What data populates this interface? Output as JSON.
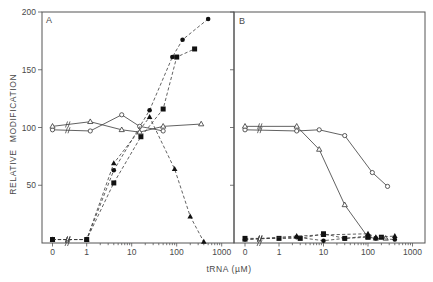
{
  "figure": {
    "ylabel_word1": "RELATIVE",
    "ylabel_word2": "MODIFICATION",
    "xlabel": "tRNA  (µM)",
    "y_tick_labels": [
      "50",
      "100",
      "150",
      "200"
    ],
    "x_tick_labels": [
      "0",
      "1",
      "10",
      "100",
      "1000"
    ]
  },
  "chart_data": [
    {
      "panel": "A",
      "type": "line",
      "title": "A",
      "xlabel": "tRNA (µM)",
      "ylabel": "RELATIVE MODIFICATION",
      "xscale": "log with axis break (0 shown left of break)",
      "x_ticks": [
        0,
        1,
        10,
        100,
        1000
      ],
      "y_ticks": [
        50,
        100,
        150,
        200
      ],
      "ylim": [
        0,
        200
      ],
      "xlim": [
        0,
        1000
      ],
      "grid": false,
      "legend": "none",
      "series": [
        {
          "name": "open circles",
          "marker": "open-circle",
          "line": "solid",
          "points": [
            [
              0,
              98
            ],
            [
              1.2,
              97
            ],
            [
              6,
              111
            ],
            [
              15,
              101
            ],
            [
              50,
              97
            ]
          ]
        },
        {
          "name": "open triangles",
          "marker": "open-triangle",
          "line": "solid",
          "points": [
            [
              0,
              101
            ],
            [
              1.2,
              105
            ],
            [
              6,
              98
            ],
            [
              15,
              96
            ],
            [
              50,
              101
            ],
            [
              350,
              103
            ]
          ]
        },
        {
          "name": "filled circles",
          "marker": "filled-circle",
          "line": "dashed",
          "points": [
            [
              0,
              3
            ],
            [
              1,
              3
            ],
            [
              4,
              63
            ],
            [
              25,
              115
            ],
            [
              80,
              161
            ],
            [
              135,
              176
            ],
            [
              500,
              194
            ]
          ]
        },
        {
          "name": "filled squares",
          "marker": "filled-square",
          "line": "dashed",
          "points": [
            [
              0,
              3
            ],
            [
              1,
              3
            ],
            [
              4,
              52
            ],
            [
              16,
              92
            ],
            [
              50,
              116
            ],
            [
              100,
              161
            ],
            [
              250,
              168
            ]
          ]
        },
        {
          "name": "filled triangles",
          "marker": "filled-triangle",
          "line": "dashed",
          "points": [
            [
              0,
              3
            ],
            [
              1,
              3
            ],
            [
              4,
              69
            ],
            [
              25,
              109
            ],
            [
              90,
              64
            ],
            [
              200,
              23
            ],
            [
              400,
              1
            ]
          ]
        }
      ]
    },
    {
      "panel": "B",
      "type": "line",
      "title": "B",
      "xlabel": "tRNA (µM)",
      "ylabel": "RELATIVE MODIFICATION",
      "xscale": "log with axis break (0 shown left of break)",
      "x_ticks": [
        0,
        1,
        10,
        100,
        1000
      ],
      "y_ticks": [
        50,
        100,
        150,
        200
      ],
      "ylim": [
        0,
        200
      ],
      "xlim": [
        0,
        1000
      ],
      "grid": false,
      "legend": "none",
      "series": [
        {
          "name": "open circles",
          "marker": "open-circle",
          "line": "solid",
          "points": [
            [
              0,
              98
            ],
            [
              2.5,
              97
            ],
            [
              8,
              98
            ],
            [
              30,
              93
            ],
            [
              125,
              61
            ],
            [
              275,
              49
            ]
          ]
        },
        {
          "name": "open triangles",
          "marker": "open-triangle",
          "line": "solid",
          "points": [
            [
              0,
              101
            ],
            [
              2.5,
              101
            ],
            [
              8,
              81
            ],
            [
              30,
              33
            ],
            [
              100,
              5
            ],
            [
              150,
              4
            ],
            [
              250,
              4
            ]
          ]
        },
        {
          "name": "filled circles",
          "marker": "filled-circle",
          "line": "dashed",
          "points": [
            [
              0,
              3
            ],
            [
              2.5,
              5
            ],
            [
              10,
              2
            ],
            [
              30,
              4
            ],
            [
              100,
              6
            ],
            [
              150,
              4
            ],
            [
              400,
              3
            ]
          ]
        },
        {
          "name": "filled squares",
          "marker": "filled-square",
          "line": "dashed",
          "points": [
            [
              0,
              4
            ],
            [
              1,
              4
            ],
            [
              3,
              4
            ],
            [
              10,
              8
            ],
            [
              30,
              4
            ],
            [
              100,
              5
            ],
            [
              200,
              5
            ]
          ]
        },
        {
          "name": "filled triangles",
          "marker": "filled-triangle",
          "line": "dashed",
          "points": [
            [
              0,
              3
            ],
            [
              2.5,
              6
            ],
            [
              10,
              7
            ],
            [
              100,
              8
            ],
            [
              150,
              5
            ],
            [
              400,
              6
            ]
          ]
        }
      ]
    }
  ]
}
